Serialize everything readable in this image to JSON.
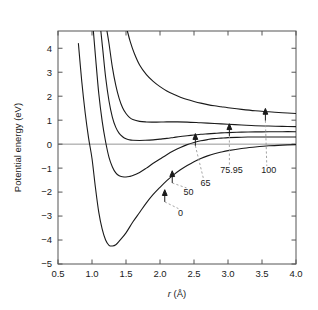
{
  "figure": {
    "background": "#ffffff",
    "curve_color": "#1a1a1a",
    "axis_color": "#555555",
    "leader_color": "#9a9a9a"
  },
  "chart_data": {
    "type": "line",
    "title": "",
    "xlabel": "r (Å)",
    "xlabel_italic_part": "r",
    "xlabel_unit_part": " (Å)",
    "ylabel": "Potential energy (eV)",
    "xlim": [
      0.5,
      4.0
    ],
    "ylim": [
      -5,
      4.72
    ],
    "grid": false,
    "legend": "inline-annotations",
    "xticks": [
      0.5,
      1.0,
      1.5,
      2.0,
      2.5,
      3.0,
      3.5,
      4.0
    ],
    "xtick_labels": [
      "0.5",
      "1.0",
      "1.5",
      "2.0",
      "2.5",
      "3.0",
      "3.5",
      "4.0"
    ],
    "yticks": [
      -5,
      -4,
      -3,
      -2,
      -1,
      0,
      1,
      2,
      3,
      4
    ],
    "ytick_labels": [
      "−5",
      "−4",
      "−3",
      "−2",
      "−1",
      "0",
      "1",
      "2",
      "3",
      "4"
    ],
    "zero_reference_line": 0,
    "series": [
      {
        "name": "0",
        "label": "0",
        "well_depth_eV": -4.25,
        "r_min": 1.3,
        "asymptote_eV": 0.0,
        "x": [
          0.8,
          0.85,
          0.9,
          0.95,
          1.0,
          1.05,
          1.1,
          1.15,
          1.2,
          1.25,
          1.3,
          1.35,
          1.4,
          1.5,
          1.6,
          1.7,
          1.8,
          1.9,
          2.0,
          2.1,
          2.2,
          2.3,
          2.4,
          2.5,
          2.6,
          2.7,
          2.8,
          2.9,
          3.0,
          3.2,
          3.4,
          3.6,
          3.8,
          4.0
        ],
        "y": [
          4.2,
          2.6,
          1.3,
          0.25,
          -0.6,
          -1.8,
          -2.85,
          -3.55,
          -4.0,
          -4.22,
          -4.25,
          -4.2,
          -4.05,
          -3.7,
          -3.25,
          -2.85,
          -2.45,
          -2.1,
          -1.8,
          -1.52,
          -1.28,
          -1.07,
          -0.89,
          -0.73,
          -0.6,
          -0.49,
          -0.4,
          -0.33,
          -0.27,
          -0.18,
          -0.12,
          -0.07,
          -0.04,
          -0.02
        ]
      },
      {
        "name": "50",
        "label": "50",
        "well_depth_eV": -1.37,
        "r_min": 1.5,
        "asymptote_eV": 0.3,
        "x": [
          1.02,
          1.05,
          1.1,
          1.15,
          1.2,
          1.25,
          1.3,
          1.35,
          1.4,
          1.45,
          1.5,
          1.55,
          1.6,
          1.7,
          1.8,
          1.9,
          2.0,
          2.1,
          2.2,
          2.3,
          2.4,
          2.5,
          2.6,
          2.7,
          2.8,
          2.9,
          3.0,
          3.2,
          3.4,
          3.6,
          3.8,
          4.0
        ],
        "y": [
          4.72,
          3.7,
          2.1,
          0.95,
          0.1,
          -0.55,
          -0.95,
          -1.2,
          -1.32,
          -1.36,
          -1.37,
          -1.35,
          -1.31,
          -1.18,
          -1.0,
          -0.8,
          -0.62,
          -0.44,
          -0.28,
          -0.14,
          -0.02,
          0.07,
          0.14,
          0.19,
          0.23,
          0.25,
          0.27,
          0.29,
          0.3,
          0.3,
          0.3,
          0.3
        ]
      },
      {
        "name": "65",
        "label": "65",
        "well_depth_eV": 0.16,
        "r_min": 1.78,
        "asymptote_eV": 0.52,
        "x": [
          1.13,
          1.16,
          1.2,
          1.25,
          1.3,
          1.35,
          1.4,
          1.45,
          1.5,
          1.55,
          1.6,
          1.7,
          1.78,
          1.9,
          2.0,
          2.1,
          2.2,
          2.3,
          2.4,
          2.5,
          2.6,
          2.7,
          2.8,
          2.9,
          3.0,
          3.2,
          3.4,
          3.6,
          3.8,
          4.0
        ],
        "y": [
          4.72,
          3.9,
          2.8,
          1.8,
          1.12,
          0.7,
          0.45,
          0.31,
          0.22,
          0.18,
          0.16,
          0.155,
          0.16,
          0.18,
          0.21,
          0.24,
          0.28,
          0.32,
          0.35,
          0.38,
          0.41,
          0.43,
          0.45,
          0.47,
          0.48,
          0.5,
          0.51,
          0.515,
          0.52,
          0.52
        ]
      },
      {
        "name": "75.95",
        "label": "75.95",
        "well_depth_eV": 0.92,
        "r_min": 1.95,
        "asymptote_eV": 0.72,
        "x": [
          1.22,
          1.25,
          1.3,
          1.35,
          1.4,
          1.45,
          1.5,
          1.55,
          1.6,
          1.7,
          1.8,
          1.9,
          1.95,
          2.05,
          2.15,
          2.25,
          2.4,
          2.6,
          2.8,
          3.0,
          3.2,
          3.4,
          3.6,
          3.8,
          4.0
        ],
        "y": [
          4.72,
          4.2,
          3.2,
          2.45,
          1.9,
          1.52,
          1.28,
          1.12,
          1.03,
          0.95,
          0.925,
          0.92,
          0.92,
          0.925,
          0.93,
          0.93,
          0.92,
          0.89,
          0.86,
          0.83,
          0.8,
          0.77,
          0.755,
          0.74,
          0.73
        ]
      },
      {
        "name": "100",
        "label": "100",
        "well_depth_eV": null,
        "r_min": null,
        "asymptote_eV": 1.28,
        "x": [
          1.52,
          1.56,
          1.62,
          1.7,
          1.8,
          1.9,
          2.0,
          2.1,
          2.2,
          2.3,
          2.4,
          2.5,
          2.6,
          2.7,
          2.8,
          2.9,
          3.0,
          3.2,
          3.4,
          3.6,
          3.8,
          4.0
        ],
        "y": [
          4.72,
          4.3,
          3.8,
          3.3,
          2.9,
          2.62,
          2.4,
          2.22,
          2.08,
          1.96,
          1.86,
          1.78,
          1.71,
          1.65,
          1.6,
          1.56,
          1.52,
          1.45,
          1.39,
          1.35,
          1.31,
          1.28
        ]
      }
    ],
    "annotations": [
      {
        "label": "0",
        "arrow_at_x": 2.07,
        "arrow_at_y": -1.95,
        "text_x": 2.3,
        "text_y": -2.98
      },
      {
        "label": "50",
        "arrow_at_x": 2.18,
        "arrow_at_y": -1.16,
        "text_x": 2.42,
        "text_y": -2.12
      },
      {
        "label": "65",
        "arrow_at_x": 2.52,
        "arrow_at_y": 0.39,
        "text_x": 2.67,
        "text_y": -1.75
      },
      {
        "label": "75.95",
        "arrow_at_x": 3.02,
        "arrow_at_y": 0.8,
        "text_x": 3.05,
        "text_y": -1.2
      },
      {
        "label": "100",
        "arrow_at_x": 3.55,
        "arrow_at_y": 1.44,
        "text_x": 3.6,
        "text_y": -1.2
      }
    ]
  }
}
